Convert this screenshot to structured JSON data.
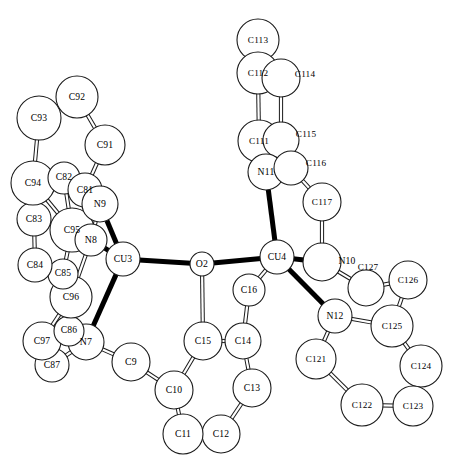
{
  "figure": {
    "type": "ortep-crystal-structure-diagram",
    "title": "",
    "background_color": "#ffffff",
    "outline_color": "#1a1a1a",
    "bond_fill_color": "#000000",
    "width": 471,
    "height": 464
  },
  "chart_data": {
    "type": "scatter",
    "title": "",
    "xlabel": "",
    "ylabel": "",
    "grid": false,
    "legend": null,
    "atoms": [
      {
        "label": "C113",
        "x": 258,
        "y": 40,
        "r": 21,
        "label_dx": 0,
        "label_dy": 0,
        "kind": "carbon"
      },
      {
        "label": "C112",
        "x": 258,
        "y": 73,
        "r": 21,
        "label_dx": 0,
        "label_dy": 0,
        "kind": "carbon"
      },
      {
        "label": "C114",
        "x": 281,
        "y": 78,
        "r": 19,
        "label_dx": 24,
        "label_dy": -4,
        "kind": "carbon"
      },
      {
        "label": "C111",
        "x": 259,
        "y": 141,
        "r": 21,
        "label_dx": 0,
        "label_dy": 0,
        "kind": "carbon"
      },
      {
        "label": "C115",
        "x": 281,
        "y": 140,
        "r": 18,
        "label_dx": 25,
        "label_dy": -6,
        "kind": "carbon"
      },
      {
        "label": "N11",
        "x": 266,
        "y": 172,
        "r": 18,
        "label_dx": 0,
        "label_dy": 0,
        "kind": "nitrogen"
      },
      {
        "label": "C116",
        "x": 291,
        "y": 168,
        "r": 17,
        "label_dx": 25,
        "label_dy": -5,
        "kind": "carbon"
      },
      {
        "label": "C117",
        "x": 322,
        "y": 202,
        "r": 19,
        "label_dx": 0,
        "label_dy": 0,
        "kind": "carbon"
      },
      {
        "label": "N10",
        "x": 322,
        "y": 262,
        "r": 19,
        "label_dx": 25,
        "label_dy": -1,
        "kind": "nitrogen"
      },
      {
        "label": "C127",
        "x": 366,
        "y": 288,
        "r": 18,
        "label_dx": 2,
        "label_dy": -21,
        "kind": "carbon"
      },
      {
        "label": "C126",
        "x": 408,
        "y": 280,
        "r": 19,
        "label_dx": 0,
        "label_dy": 0,
        "kind": "carbon"
      },
      {
        "label": "C125",
        "x": 392,
        "y": 326,
        "r": 21,
        "label_dx": 0,
        "label_dy": 0,
        "kind": "carbon"
      },
      {
        "label": "C124",
        "x": 421,
        "y": 366,
        "r": 21,
        "label_dx": 0,
        "label_dy": 0,
        "kind": "carbon"
      },
      {
        "label": "C123",
        "x": 413,
        "y": 406,
        "r": 20,
        "label_dx": 0,
        "label_dy": 0,
        "kind": "carbon"
      },
      {
        "label": "C122",
        "x": 362,
        "y": 405,
        "r": 21,
        "label_dx": 0,
        "label_dy": 0,
        "kind": "carbon"
      },
      {
        "label": "C121",
        "x": 316,
        "y": 359,
        "r": 20,
        "label_dx": 0,
        "label_dy": 0,
        "kind": "carbon"
      },
      {
        "label": "N12",
        "x": 335,
        "y": 316,
        "r": 17,
        "label_dx": 0,
        "label_dy": 0,
        "kind": "nitrogen"
      },
      {
        "label": "CU4",
        "x": 277,
        "y": 257,
        "r": 17,
        "label_dx": 0,
        "label_dy": 0,
        "kind": "copper"
      },
      {
        "label": "CU3",
        "x": 123,
        "y": 259,
        "r": 17,
        "label_dx": 0,
        "label_dy": 0,
        "kind": "copper"
      },
      {
        "label": "O2",
        "x": 202,
        "y": 264,
        "r": 12,
        "label_dx": 0,
        "label_dy": 0,
        "kind": "oxygen"
      },
      {
        "label": "C16",
        "x": 249,
        "y": 290,
        "r": 16,
        "label_dx": 0,
        "label_dy": 0,
        "kind": "carbon"
      },
      {
        "label": "C14",
        "x": 243,
        "y": 341,
        "r": 18,
        "label_dx": 0,
        "label_dy": 0,
        "kind": "carbon"
      },
      {
        "label": "C15",
        "x": 203,
        "y": 341,
        "r": 19,
        "label_dx": 0,
        "label_dy": 0,
        "kind": "carbon"
      },
      {
        "label": "C13",
        "x": 252,
        "y": 388,
        "r": 19,
        "label_dx": 0,
        "label_dy": 0,
        "kind": "carbon"
      },
      {
        "label": "C12",
        "x": 221,
        "y": 434,
        "r": 19,
        "label_dx": 0,
        "label_dy": 0,
        "kind": "carbon"
      },
      {
        "label": "C11",
        "x": 183,
        "y": 434,
        "r": 20,
        "label_dx": 0,
        "label_dy": 0,
        "kind": "carbon"
      },
      {
        "label": "C10",
        "x": 174,
        "y": 390,
        "r": 19,
        "label_dx": 0,
        "label_dy": 0,
        "kind": "carbon"
      },
      {
        "label": "C9",
        "x": 131,
        "y": 362,
        "r": 19,
        "label_dx": 0,
        "label_dy": 0,
        "kind": "carbon"
      },
      {
        "label": "N7",
        "x": 86,
        "y": 342,
        "r": 18,
        "label_dx": 0,
        "label_dy": 0,
        "kind": "nitrogen"
      },
      {
        "label": "C87",
        "x": 52,
        "y": 365,
        "r": 17,
        "label_dx": 0,
        "label_dy": 0,
        "kind": "carbon"
      },
      {
        "label": "C97",
        "x": 42,
        "y": 341,
        "r": 19,
        "label_dx": 0,
        "label_dy": 0,
        "kind": "carbon"
      },
      {
        "label": "C86",
        "x": 69,
        "y": 331,
        "r": 15,
        "label_dx": 0,
        "label_dy": -1,
        "kind": "carbon"
      },
      {
        "label": "C96",
        "x": 71,
        "y": 297,
        "r": 21,
        "label_dx": 0,
        "label_dy": 0,
        "kind": "carbon"
      },
      {
        "label": "C85",
        "x": 63,
        "y": 274,
        "r": 15,
        "label_dx": 0,
        "label_dy": -1,
        "kind": "carbon"
      },
      {
        "label": "C84",
        "x": 35,
        "y": 265,
        "r": 17,
        "label_dx": 0,
        "label_dy": 0,
        "kind": "carbon"
      },
      {
        "label": "C83",
        "x": 34,
        "y": 219,
        "r": 17,
        "label_dx": 0,
        "label_dy": 0,
        "kind": "carbon"
      },
      {
        "label": "C95",
        "x": 72,
        "y": 230,
        "r": 22,
        "label_dx": 0,
        "label_dy": 0,
        "kind": "carbon"
      },
      {
        "label": "C94",
        "x": 33,
        "y": 183,
        "r": 22,
        "label_dx": 0,
        "label_dy": 0,
        "kind": "carbon"
      },
      {
        "label": "C82",
        "x": 64,
        "y": 178,
        "r": 16,
        "label_dx": 0,
        "label_dy": -1,
        "kind": "carbon"
      },
      {
        "label": "C81",
        "x": 85,
        "y": 190,
        "r": 17,
        "label_dx": 0,
        "label_dy": 0,
        "kind": "carbon"
      },
      {
        "label": "N9",
        "x": 100,
        "y": 204,
        "r": 18,
        "label_dx": 0,
        "label_dy": 0,
        "kind": "nitrogen"
      },
      {
        "label": "N8",
        "x": 91,
        "y": 240,
        "r": 16,
        "label_dx": 0,
        "label_dy": 0,
        "kind": "nitrogen"
      },
      {
        "label": "C91",
        "x": 105,
        "y": 145,
        "r": 20,
        "label_dx": 0,
        "label_dy": 0,
        "kind": "carbon"
      },
      {
        "label": "C92",
        "x": 77,
        "y": 97,
        "r": 21,
        "label_dx": 0,
        "label_dy": 0,
        "kind": "carbon"
      },
      {
        "label": "C93",
        "x": 39,
        "y": 118,
        "r": 22,
        "label_dx": 0,
        "label_dy": 0,
        "kind": "carbon"
      }
    ],
    "bonds": [
      {
        "from": "C113",
        "to": "C112",
        "style": "open"
      },
      {
        "from": "C112",
        "to": "C111",
        "style": "open"
      },
      {
        "from": "C114",
        "to": "C115",
        "style": "open"
      },
      {
        "from": "C111",
        "to": "N11",
        "style": "open"
      },
      {
        "from": "C115",
        "to": "C116",
        "style": "open"
      },
      {
        "from": "N11",
        "to": "C116",
        "style": "open"
      },
      {
        "from": "C116",
        "to": "C117",
        "style": "open"
      },
      {
        "from": "C117",
        "to": "N10",
        "style": "open"
      },
      {
        "from": "N11",
        "to": "CU4",
        "style": "solid"
      },
      {
        "from": "N10",
        "to": "CU4",
        "style": "solid"
      },
      {
        "from": "N12",
        "to": "CU4",
        "style": "solid"
      },
      {
        "from": "CU4",
        "to": "O2",
        "style": "solid"
      },
      {
        "from": "CU4",
        "to": "C16",
        "style": "open"
      },
      {
        "from": "N10",
        "to": "C127",
        "style": "open"
      },
      {
        "from": "C127",
        "to": "C126",
        "style": "open"
      },
      {
        "from": "C126",
        "to": "C125",
        "style": "open"
      },
      {
        "from": "C125",
        "to": "N12",
        "style": "open"
      },
      {
        "from": "C125",
        "to": "C124",
        "style": "open"
      },
      {
        "from": "C124",
        "to": "C123",
        "style": "open"
      },
      {
        "from": "C123",
        "to": "C122",
        "style": "open"
      },
      {
        "from": "C122",
        "to": "C121",
        "style": "open"
      },
      {
        "from": "C121",
        "to": "N12",
        "style": "open"
      },
      {
        "from": "O2",
        "to": "C15",
        "style": "open"
      },
      {
        "from": "C16",
        "to": "C14",
        "style": "open"
      },
      {
        "from": "C15",
        "to": "C14",
        "style": "open"
      },
      {
        "from": "C14",
        "to": "C13",
        "style": "open"
      },
      {
        "from": "C13",
        "to": "C12",
        "style": "open"
      },
      {
        "from": "C12",
        "to": "C11",
        "style": "open"
      },
      {
        "from": "C11",
        "to": "C10",
        "style": "open"
      },
      {
        "from": "C10",
        "to": "C15",
        "style": "open"
      },
      {
        "from": "C10",
        "to": "C9",
        "style": "open"
      },
      {
        "from": "C9",
        "to": "N7",
        "style": "open"
      },
      {
        "from": "N7",
        "to": "CU3",
        "style": "solid"
      },
      {
        "from": "N8",
        "to": "CU3",
        "style": "solid"
      },
      {
        "from": "N9",
        "to": "CU3",
        "style": "solid"
      },
      {
        "from": "CU3",
        "to": "O2",
        "style": "solid"
      },
      {
        "from": "N7",
        "to": "C87",
        "style": "open"
      },
      {
        "from": "N7",
        "to": "C86",
        "style": "open"
      },
      {
        "from": "C86",
        "to": "C97",
        "style": "open"
      },
      {
        "from": "C97",
        "to": "C87",
        "style": "open"
      },
      {
        "from": "C86",
        "to": "C96",
        "style": "open"
      },
      {
        "from": "C96",
        "to": "C97",
        "style": "open"
      },
      {
        "from": "C96",
        "to": "C85",
        "style": "open"
      },
      {
        "from": "C96",
        "to": "N8",
        "style": "open"
      },
      {
        "from": "C85",
        "to": "C84",
        "style": "open"
      },
      {
        "from": "C85",
        "to": "C95",
        "style": "open"
      },
      {
        "from": "C84",
        "to": "C83",
        "style": "open"
      },
      {
        "from": "C83",
        "to": "C94",
        "style": "open"
      },
      {
        "from": "C95",
        "to": "C94",
        "style": "open"
      },
      {
        "from": "C95",
        "to": "N8",
        "style": "open"
      },
      {
        "from": "C95",
        "to": "C82",
        "style": "open"
      },
      {
        "from": "C94",
        "to": "C82",
        "style": "open"
      },
      {
        "from": "C82",
        "to": "C81",
        "style": "open"
      },
      {
        "from": "C81",
        "to": "N9",
        "style": "open"
      },
      {
        "from": "C81",
        "to": "C91",
        "style": "open"
      },
      {
        "from": "N9",
        "to": "N8",
        "style": "open"
      },
      {
        "from": "C91",
        "to": "C92",
        "style": "open"
      },
      {
        "from": "C92",
        "to": "C93",
        "style": "open"
      },
      {
        "from": "C93",
        "to": "C94",
        "style": "open"
      }
    ]
  }
}
